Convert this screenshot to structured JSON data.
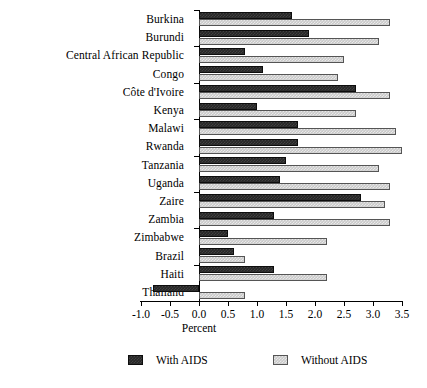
{
  "chart_data": {
    "type": "bar",
    "orientation": "horizontal",
    "title": "",
    "xlabel": "Percent",
    "ylabel": "",
    "xlim": [
      -1.0,
      3.5
    ],
    "xticks": [
      "-1.0",
      "-0.5",
      "0.0",
      "0.5",
      "1.0",
      "1.5",
      "2.0",
      "2.5",
      "3.0",
      "3.5"
    ],
    "xtick_values": [
      -1.0,
      -0.5,
      0.0,
      0.5,
      1.0,
      1.5,
      2.0,
      2.5,
      3.0,
      3.5
    ],
    "grid": false,
    "legend_position": "bottom",
    "categories": [
      "Burkina",
      "Burundi",
      "Central African Republic",
      "Congo",
      "Côte d'Ivoire",
      "Kenya",
      "Malawi",
      "Rwanda",
      "Tanzania",
      "Uganda",
      "Zaire",
      "Zambia",
      "Zimbabwe",
      "Brazil",
      "Haiti",
      "Thailand"
    ],
    "series": [
      {
        "name": "With AIDS",
        "color": "#262626",
        "values": [
          1.6,
          1.9,
          0.8,
          1.1,
          2.7,
          1.0,
          1.7,
          1.7,
          1.5,
          1.4,
          2.8,
          1.3,
          0.5,
          0.6,
          1.3,
          -0.8
        ]
      },
      {
        "name": "Without AIDS",
        "color": "#c9c9c9",
        "values": [
          3.3,
          3.1,
          2.5,
          2.4,
          3.3,
          2.7,
          3.4,
          3.5,
          3.1,
          3.3,
          3.2,
          3.3,
          2.2,
          0.8,
          2.2,
          0.8
        ]
      }
    ]
  },
  "legend": {
    "items": [
      {
        "label": "With AIDS"
      },
      {
        "label": "Without AIDS"
      }
    ]
  }
}
